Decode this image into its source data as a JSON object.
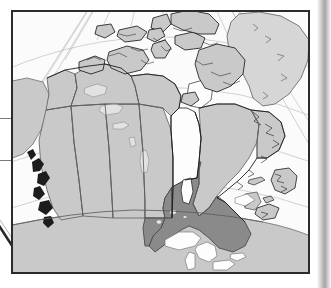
{
  "image": {
    "kind": "reference-map",
    "subject": "Canada",
    "projection_hint": "polar conic with converging meridians",
    "frame": {
      "x": 11,
      "y": 10,
      "width": 299,
      "height": 264,
      "border_color": "#2b2b2b"
    }
  },
  "colors": {
    "page_background": "#ffffff",
    "map_background": "#fbfbfb",
    "water": "#fdfdfd",
    "land_default": "#c9c9c9",
    "land_neighbor": "#d6d6d6",
    "highlight_fill": "#8a8a8a",
    "coastline": "#1d1d1d",
    "internal_border": "#5d5d5d",
    "graticule": "#b9b9b9",
    "frame_border": "#2b2b2b",
    "margin_rule": "#7a7a7a"
  },
  "highlight": {
    "name": "Ontario",
    "role": "selected-province",
    "fill": "#8a8a8a"
  },
  "regions": [
    {
      "id": "yukon",
      "name": "Yukon",
      "fill": "land_default",
      "highlighted": false
    },
    {
      "id": "northwest-territories",
      "name": "Northwest Territories",
      "fill": "land_default",
      "highlighted": false
    },
    {
      "id": "nunavut",
      "name": "Nunavut",
      "fill": "land_default",
      "highlighted": false
    },
    {
      "id": "british-columbia",
      "name": "British Columbia",
      "fill": "land_default",
      "highlighted": false
    },
    {
      "id": "alberta",
      "name": "Alberta",
      "fill": "land_default",
      "highlighted": false
    },
    {
      "id": "saskatchewan",
      "name": "Saskatchewan",
      "fill": "land_default",
      "highlighted": false
    },
    {
      "id": "manitoba",
      "name": "Manitoba",
      "fill": "land_default",
      "highlighted": false
    },
    {
      "id": "ontario",
      "name": "Ontario",
      "fill": "highlight_fill",
      "highlighted": true
    },
    {
      "id": "quebec",
      "name": "Quebec",
      "fill": "land_default",
      "highlighted": false
    },
    {
      "id": "newfoundland-labrador",
      "name": "Newfoundland and Labrador",
      "fill": "land_default",
      "highlighted": false
    },
    {
      "id": "new-brunswick",
      "name": "New Brunswick",
      "fill": "land_default",
      "highlighted": false
    },
    {
      "id": "nova-scotia",
      "name": "Nova Scotia",
      "fill": "land_default",
      "highlighted": false
    },
    {
      "id": "prince-edward-island",
      "name": "Prince Edward Island",
      "fill": "land_default",
      "highlighted": false
    },
    {
      "id": "greenland",
      "name": "Greenland",
      "fill": "land_neighbor",
      "highlighted": false
    },
    {
      "id": "united-states",
      "name": "United States",
      "fill": "land_default",
      "highlighted": false
    },
    {
      "id": "alaska",
      "name": "Alaska",
      "fill": "land_default",
      "highlighted": false
    }
  ],
  "water_bodies": [
    {
      "id": "hudson-bay",
      "name": "Hudson Bay"
    },
    {
      "id": "arctic-ocean",
      "name": "Arctic Ocean"
    },
    {
      "id": "baffin-bay",
      "name": "Baffin Bay"
    },
    {
      "id": "atlantic-ocean",
      "name": "Atlantic Ocean"
    },
    {
      "id": "pacific-ocean",
      "name": "Pacific Ocean"
    },
    {
      "id": "great-lakes",
      "name": "Great Lakes"
    },
    {
      "id": "great-bear-lake",
      "name": "Great Bear Lake"
    },
    {
      "id": "great-slave-lake",
      "name": "Great Slave Lake"
    },
    {
      "id": "lake-winnipeg",
      "name": "Lake Winnipeg"
    }
  ],
  "margin": {
    "rules": [
      {
        "id": "upper-rule",
        "y": 118,
        "width": 13
      },
      {
        "id": "lower-rule",
        "y": 160,
        "width": 13
      }
    ],
    "diagonal_mark": {
      "id": "diagonal-mark",
      "present": true
    }
  },
  "labels": {
    "none_visible": "No text labels are rendered on this map"
  }
}
